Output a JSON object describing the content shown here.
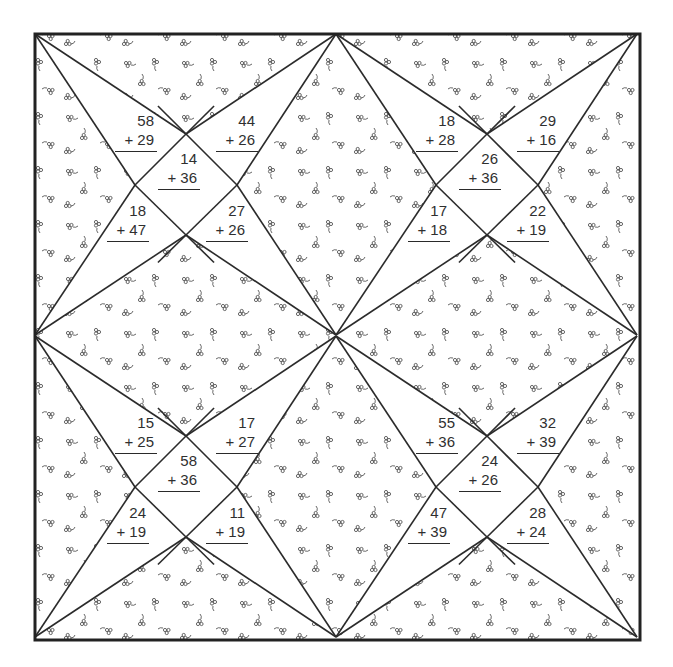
{
  "worksheet": {
    "title": "Two-digit addition quilt puzzle",
    "colors": {
      "line": "#2b2b2b",
      "border": "#222222",
      "pattern": "#555555",
      "background": "#ffffff",
      "text": "#2f2f2f"
    },
    "blocks": [
      {
        "name": "top-left",
        "problems": [
          {
            "position": "upper-left",
            "addend1": "58",
            "addend2": "+ 29"
          },
          {
            "position": "upper-right",
            "addend1": "44",
            "addend2": "+ 26"
          },
          {
            "position": "center",
            "addend1": "14",
            "addend2": "+ 36"
          },
          {
            "position": "lower-left",
            "addend1": "18",
            "addend2": "+ 47"
          },
          {
            "position": "lower-right",
            "addend1": "27",
            "addend2": "+ 26"
          }
        ]
      },
      {
        "name": "top-right",
        "problems": [
          {
            "position": "upper-left",
            "addend1": "18",
            "addend2": "+ 28"
          },
          {
            "position": "upper-right",
            "addend1": "29",
            "addend2": "+ 16"
          },
          {
            "position": "center",
            "addend1": "26",
            "addend2": "+ 36"
          },
          {
            "position": "lower-left",
            "addend1": "17",
            "addend2": "+ 18"
          },
          {
            "position": "lower-right",
            "addend1": "22",
            "addend2": "+ 19"
          }
        ]
      },
      {
        "name": "bottom-left",
        "problems": [
          {
            "position": "upper-left",
            "addend1": "15",
            "addend2": "+ 25"
          },
          {
            "position": "upper-right",
            "addend1": "17",
            "addend2": "+ 27"
          },
          {
            "position": "center",
            "addend1": "58",
            "addend2": "+ 36"
          },
          {
            "position": "lower-left",
            "addend1": "24",
            "addend2": "+ 19"
          },
          {
            "position": "lower-right",
            "addend1": "11",
            "addend2": "+ 19"
          }
        ]
      },
      {
        "name": "bottom-right",
        "problems": [
          {
            "position": "upper-left",
            "addend1": "55",
            "addend2": "+ 36"
          },
          {
            "position": "upper-right",
            "addend1": "32",
            "addend2": "+ 39"
          },
          {
            "position": "center",
            "addend1": "24",
            "addend2": "+ 26"
          },
          {
            "position": "lower-left",
            "addend1": "47",
            "addend2": "+ 39"
          },
          {
            "position": "lower-right",
            "addend1": "28",
            "addend2": "+ 24"
          }
        ]
      }
    ]
  }
}
